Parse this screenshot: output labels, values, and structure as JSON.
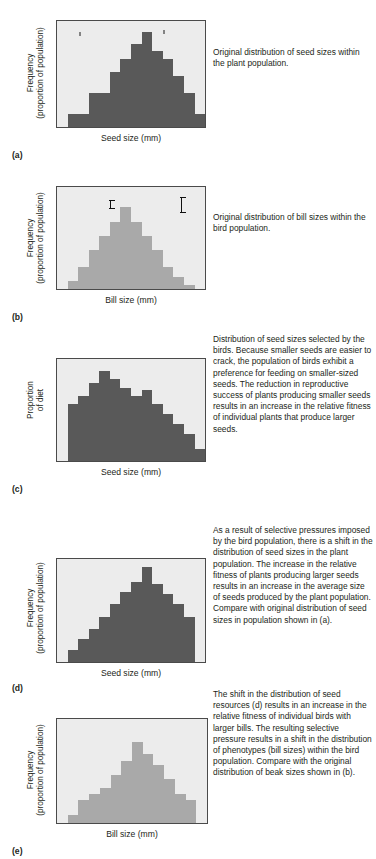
{
  "figure": {
    "colors": {
      "plot_background": "#ececec",
      "plot_border": "#4a4a4a",
      "seed_bar": "#595959",
      "bill_bar": "#a9a9a9",
      "text": "#231f20"
    }
  },
  "panels": [
    {
      "letter": "(a)",
      "ylabel_line1": "Frequency",
      "ylabel_line2": "(proportion of population)",
      "xlabel": "Seed size (mm)",
      "caption": "Original distribution of seed sizes within the plant population.",
      "icons": [
        "seed-small-icon",
        "seed-large-icon"
      ],
      "chart_data": {
        "type": "bar",
        "title": "Original distribution of seed sizes within the plant population",
        "xlabel": "Seed size (mm)",
        "ylabel": "Frequency (proportion of population)",
        "categories": [
          "1",
          "2",
          "3",
          "4",
          "5",
          "6",
          "7",
          "8",
          "9",
          "10",
          "11",
          "12",
          "13",
          "14"
        ],
        "values": [
          0,
          12,
          12,
          32,
          32,
          52,
          64,
          78,
          90,
          72,
          64,
          48,
          32,
          12
        ],
        "ylim": [
          0,
          100
        ],
        "grid": false,
        "legend": "none",
        "bar_color": "#595959"
      }
    },
    {
      "letter": "(b)",
      "ylabel_line1": "Frequency",
      "ylabel_line2": "(proportion of population)",
      "xlabel": "Bill size (mm)",
      "caption": "Original distribution of bill sizes within the bird population.",
      "icons": [
        "bird-head-small-bill-icon",
        "bird-head-large-bill-icon"
      ],
      "chart_data": {
        "type": "bar",
        "title": "Original distribution of bill sizes within the bird population",
        "xlabel": "Bill size (mm)",
        "ylabel": "Frequency (proportion of population)",
        "categories": [
          "1",
          "2",
          "3",
          "4",
          "5",
          "6",
          "7",
          "8",
          "9",
          "10",
          "11",
          "12",
          "13",
          "14"
        ],
        "values": [
          0,
          8,
          22,
          38,
          52,
          66,
          80,
          66,
          52,
          38,
          22,
          12,
          4,
          0
        ],
        "ylim": [
          0,
          100
        ],
        "grid": false,
        "legend": "none",
        "bar_color": "#a9a9a9"
      }
    },
    {
      "letter": "(c)",
      "ylabel_line1": "Proportion",
      "ylabel_line2": "of diet",
      "xlabel": "Seed size (mm)",
      "caption": "Distribution of seed sizes selected by the birds. Because smaller seeds are easier to crack, the population of birds exhibit a preference for feeding on smaller-sized seeds. The reduction in reproductive success of plants producing smaller seeds results in an increase in the relative fitness of individual plants that produce larger seeds.",
      "icons": [],
      "chart_data": {
        "type": "bar",
        "title": "Distribution of seed sizes selected by the birds",
        "xlabel": "Seed size (mm)",
        "ylabel": "Proportion of diet",
        "categories": [
          "1",
          "2",
          "3",
          "4",
          "5",
          "6",
          "7",
          "8",
          "9",
          "10",
          "11",
          "12",
          "13",
          "14"
        ],
        "values": [
          0,
          56,
          64,
          76,
          88,
          80,
          72,
          64,
          70,
          56,
          46,
          36,
          26,
          12
        ],
        "ylim": [
          0,
          100
        ],
        "grid": false,
        "legend": "none",
        "bar_color": "#595959"
      }
    },
    {
      "letter": "(d)",
      "ylabel_line1": "Frequency",
      "ylabel_line2": "(proportion of population)",
      "xlabel": "Seed size (mm)",
      "caption": "As a result of selective pressures imposed by the bird population, there is a shift in the distribution of seed sizes in the plant population. The increase in the relative fitness of plants producing larger seeds results in an increase in the average size of seeds produced by the plant population. Compare with original distribution of seed sizes in population shown in (a).",
      "icons": [],
      "chart_data": {
        "type": "bar",
        "title": "Shifted distribution of seed sizes in the plant population",
        "xlabel": "Seed size (mm)",
        "ylabel": "Frequency (proportion of population)",
        "categories": [
          "1",
          "2",
          "3",
          "4",
          "5",
          "6",
          "7",
          "8",
          "9",
          "10",
          "11",
          "12",
          "13",
          "14"
        ],
        "values": [
          0,
          12,
          22,
          32,
          44,
          56,
          68,
          78,
          92,
          76,
          66,
          56,
          44,
          0
        ],
        "ylim": [
          0,
          100
        ],
        "grid": false,
        "legend": "none",
        "bar_color": "#595959"
      }
    },
    {
      "letter": "(e)",
      "ylabel_line1": "Frequency",
      "ylabel_line2": "(proportion of population)",
      "xlabel": "Bill size (mm)",
      "caption": "The shift in the distribution of seed resources (d) results in an increase in the relative fitness of individual birds with larger bills. The resulting selective pressure results in a shift in the distribution of phenotypes (bill sizes) within the bird population. Compare with the original distribution of beak sizes shown in (b).",
      "icons": [],
      "chart_data": {
        "type": "bar",
        "title": "Shifted distribution of bill sizes within the bird population",
        "xlabel": "Bill size (mm)",
        "ylabel": "Frequency (proportion of population)",
        "categories": [
          "1",
          "2",
          "3",
          "4",
          "5",
          "6",
          "7",
          "8",
          "9",
          "10",
          "11",
          "12",
          "13",
          "14"
        ],
        "values": [
          0,
          8,
          22,
          28,
          34,
          46,
          60,
          78,
          66,
          56,
          42,
          28,
          22,
          0
        ],
        "ylim": [
          0,
          100
        ],
        "grid": false,
        "legend": "none",
        "bar_color": "#a9a9a9"
      }
    }
  ]
}
